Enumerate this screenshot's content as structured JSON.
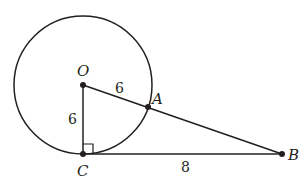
{
  "diagram": {
    "type": "geometry",
    "colors": {
      "ink": "#231f20",
      "background": "#ffffff"
    },
    "circle": {
      "center_label": "O",
      "cx": 83,
      "cy": 85,
      "r": 69
    },
    "points": {
      "O": {
        "label": "O",
        "x": 83,
        "y": 85
      },
      "A": {
        "label": "A",
        "x": 148,
        "y": 107
      },
      "B": {
        "label": "B",
        "x": 282,
        "y": 154
      },
      "C": {
        "label": "C",
        "x": 83,
        "y": 154
      }
    },
    "segments": [
      {
        "from": "O",
        "to": "B"
      },
      {
        "from": "O",
        "to": "C"
      },
      {
        "from": "C",
        "to": "B"
      }
    ],
    "measures": {
      "OA": "6",
      "OC": "6",
      "CB": "8"
    },
    "right_angle_at": "C"
  }
}
